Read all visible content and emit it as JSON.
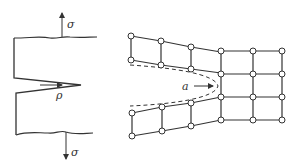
{
  "left_figure": {
    "title": "Notched specimen under tension",
    "stress_top_label": "σ",
    "stress_bottom_label": "σ",
    "notch_radius_label": "ρ"
  },
  "right_figure": {
    "title": "Atomic lattice at crack tip",
    "crack_length_label": "a",
    "upper_left_nodes": [
      [
        131,
        36
      ],
      [
        161,
        41
      ],
      [
        191,
        47
      ],
      [
        221,
        52
      ],
      [
        131,
        60
      ],
      [
        161,
        65
      ],
      [
        191,
        69
      ],
      [
        221,
        73
      ]
    ],
    "lower_left_nodes": [
      [
        132,
        113
      ],
      [
        162,
        107
      ],
      [
        191,
        103
      ],
      [
        221,
        97
      ],
      [
        132,
        136
      ],
      [
        162,
        131
      ],
      [
        191,
        126
      ],
      [
        221,
        120
      ]
    ],
    "right_grid_columns": [
      221,
      253,
      282
    ],
    "right_grid_rows": [
      51,
      74,
      97,
      120
    ]
  },
  "colors": {
    "line": "#333333",
    "background": "#ffffff"
  }
}
